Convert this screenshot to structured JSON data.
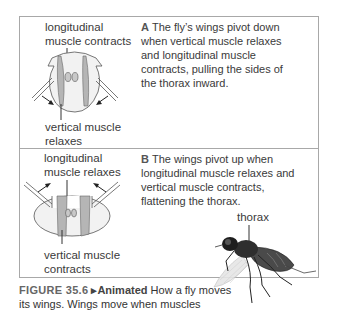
{
  "panel_a": {
    "top_label_line1": "longitudinal",
    "top_label_line2": "muscle contracts",
    "bottom_label_line1": "vertical muscle",
    "bottom_label_line2": "relaxes",
    "letter": "A",
    "description": "The fly’s wings pivot down when vertical muscle relaxes and longitudinal muscle contracts, pulling the sides of the thorax inward."
  },
  "panel_b": {
    "top_label_line1": "longitudinal",
    "top_label_line2": "muscle relaxes",
    "bottom_label_line1": "vertical muscle",
    "bottom_label_line2": "contracts",
    "letter": "B",
    "description": "The wings pivot up when longitudinal muscle relaxes and vertical muscle contracts, flattening the thorax.",
    "fly_label": "thorax"
  },
  "caption": {
    "figure_number": "FIGURE 35.6",
    "animated_marker": "▸Animated",
    "text": " How a fly moves its wings. Wings move when muscles"
  },
  "colors": {
    "border": "#a8a8a8",
    "muscle_fill": "#b5b5b5",
    "thorax_fill": "#f2f2f2",
    "text": "#3a3a3a"
  }
}
